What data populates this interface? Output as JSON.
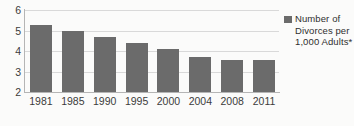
{
  "chart_data": {
    "type": "bar",
    "title": "",
    "xlabel": "",
    "ylabel": "",
    "categories": [
      "1981",
      "1985",
      "1990",
      "1995",
      "2000",
      "2004",
      "2008",
      "2011"
    ],
    "values": [
      5.25,
      5.0,
      4.7,
      4.4,
      4.1,
      3.7,
      3.55,
      3.55
    ],
    "series": [
      {
        "name": "Number of Divorces per 1,000 Adults*",
        "values": [
          5.25,
          5.0,
          4.7,
          4.4,
          4.1,
          3.7,
          3.55,
          3.55
        ]
      }
    ],
    "ylim": [
      2,
      6
    ],
    "yticks": [
      "6",
      "5",
      "4",
      "3",
      "2"
    ],
    "grid": true,
    "legend_position": "right",
    "bar_color": "#6b6b6b",
    "gridline_color": "#d9d9d9",
    "axis_color": "#b5b5b5",
    "background_color": "#fbfbfa"
  },
  "legend": {
    "swatch_name": "legend-color-swatch",
    "label": "Number of Divorces per 1,000 Adults*"
  }
}
